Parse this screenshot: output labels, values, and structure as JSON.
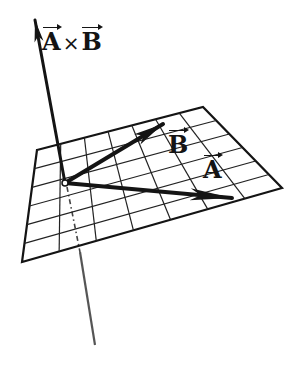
{
  "diagram": {
    "title_label": {
      "a": "A",
      "op": "×",
      "b": "B"
    },
    "vector_a_label": "A",
    "vector_b_label": "B",
    "colors": {
      "ink": "#141414",
      "grid": "#222222",
      "background": "#ffffff",
      "below_axis": "#555555"
    },
    "plane": {
      "corners": [
        [
          37,
          150
        ],
        [
          203,
          107
        ],
        [
          282,
          188
        ],
        [
          22,
          262
        ]
      ],
      "divisions_u": 7,
      "divisions_v": 6
    },
    "origin": [
      65,
      183
    ],
    "cross_product_tip": [
      35,
      20
    ],
    "vector_a_tip": [
      232,
      198
    ],
    "vector_b_tip": [
      163,
      124
    ],
    "axis_below_end": [
      95,
      345
    ]
  }
}
